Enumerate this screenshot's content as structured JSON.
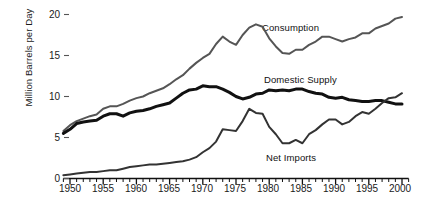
{
  "chart_data": {
    "type": "line",
    "title": "",
    "xlabel": "",
    "ylabel": "Million Barrels per Day",
    "xlim": [
      1949,
      2001
    ],
    "ylim": [
      0,
      20.8
    ],
    "yticks": [
      0,
      5,
      10,
      15,
      20
    ],
    "ytick_labels": [
      "0",
      "5",
      "10",
      "15",
      "20"
    ],
    "xticks": [
      1950,
      1955,
      1960,
      1965,
      1970,
      1975,
      1980,
      1985,
      1990,
      1995,
      2000
    ],
    "xtick_labels": [
      "1950",
      "1955",
      "1960",
      "1965",
      "1970",
      "1975",
      "1980",
      "1985",
      "1990",
      "1995",
      "2000"
    ],
    "minor_xticks_every": 1,
    "grid": false,
    "legend": "inline-annotations",
    "x": [
      1949,
      1950,
      1951,
      1952,
      1953,
      1954,
      1955,
      1956,
      1957,
      1958,
      1959,
      1960,
      1961,
      1962,
      1963,
      1964,
      1965,
      1966,
      1967,
      1968,
      1969,
      1970,
      1971,
      1972,
      1973,
      1974,
      1975,
      1976,
      1977,
      1978,
      1979,
      1980,
      1981,
      1982,
      1983,
      1984,
      1985,
      1986,
      1987,
      1988,
      1989,
      1990,
      1991,
      1992,
      1993,
      1994,
      1995,
      1996,
      1997,
      1998,
      1999,
      2000
    ],
    "series": [
      {
        "name": "Consumption",
        "color": "#555555",
        "width": 2.0,
        "values": [
          5.8,
          6.5,
          7.0,
          7.3,
          7.6,
          7.8,
          8.5,
          8.8,
          8.8,
          9.1,
          9.5,
          9.8,
          10.0,
          10.4,
          10.7,
          11.0,
          11.5,
          12.1,
          12.6,
          13.4,
          14.1,
          14.7,
          15.2,
          16.4,
          17.3,
          16.7,
          16.3,
          17.5,
          18.4,
          18.8,
          18.5,
          17.1,
          16.1,
          15.3,
          15.2,
          15.7,
          15.7,
          16.3,
          16.7,
          17.3,
          17.3,
          17.0,
          16.7,
          17.0,
          17.2,
          17.7,
          17.7,
          18.3,
          18.6,
          18.9,
          19.5,
          19.7
        ]
      },
      {
        "name": "Domestic Supply",
        "color": "#111111",
        "width": 3.0,
        "values": [
          5.5,
          6.0,
          6.7,
          6.9,
          7.0,
          7.1,
          7.6,
          7.9,
          7.9,
          7.6,
          8.0,
          8.2,
          8.3,
          8.5,
          8.8,
          9.0,
          9.2,
          9.8,
          10.4,
          10.8,
          10.9,
          11.3,
          11.2,
          11.2,
          10.9,
          10.5,
          10.0,
          9.7,
          9.9,
          10.3,
          10.4,
          10.8,
          10.7,
          10.8,
          10.7,
          10.9,
          10.9,
          10.6,
          10.4,
          10.3,
          9.9,
          9.8,
          9.9,
          9.6,
          9.5,
          9.4,
          9.4,
          9.5,
          9.5,
          9.3,
          9.1,
          9.1
        ]
      },
      {
        "name": "Net Imports",
        "color": "#333333",
        "width": 2.0,
        "values": [
          0.4,
          0.5,
          0.6,
          0.7,
          0.8,
          0.8,
          0.9,
          1.0,
          1.0,
          1.2,
          1.4,
          1.5,
          1.6,
          1.7,
          1.7,
          1.8,
          1.9,
          2.0,
          2.1,
          2.3,
          2.6,
          3.2,
          3.7,
          4.5,
          6.0,
          5.9,
          5.8,
          7.0,
          8.5,
          8.0,
          7.9,
          6.3,
          5.4,
          4.3,
          4.3,
          4.7,
          4.3,
          5.4,
          5.9,
          6.6,
          7.2,
          7.2,
          6.6,
          6.9,
          7.6,
          8.1,
          7.9,
          8.5,
          9.2,
          9.8,
          9.9,
          10.4
        ]
      }
    ],
    "annotations": [
      {
        "text": "Consumption",
        "x": 1982,
        "y": 18.0
      },
      {
        "text": "Domestic Supply",
        "x": 1982,
        "y": 12.2
      },
      {
        "text": "Net Imports",
        "x": 1983,
        "y": 3.3
      }
    ]
  }
}
